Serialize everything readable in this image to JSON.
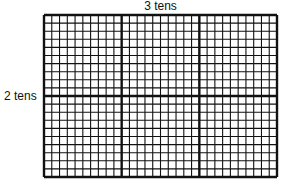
{
  "diagram": {
    "top_label": "3 tens",
    "left_label": "2 tens",
    "grid": {
      "columns": 30,
      "rows": 20,
      "major_every": 10,
      "x": 44,
      "y": 15,
      "width": 233,
      "height": 162,
      "line_color": "#111111"
    }
  }
}
